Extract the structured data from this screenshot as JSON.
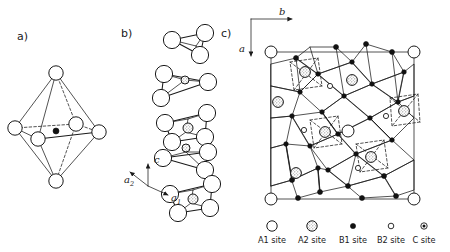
{
  "figure": {
    "type": "crystal-structure-diagram",
    "width": 450,
    "height": 252,
    "background": "#ffffff",
    "ink_color": "#1a1a1a"
  },
  "panels": [
    {
      "id": "a",
      "label": "a)",
      "label_x": 17,
      "label_y": 40,
      "description": "Single coordination octahedron with central cation",
      "center": {
        "x": 56,
        "y": 122
      }
    },
    {
      "id": "b",
      "label": "b)",
      "label_x": 121,
      "label_y": 37,
      "description": "Chain of face-sharing octahedral clusters viewed along the c axis"
    },
    {
      "id": "c",
      "label": "c)",
      "label_x": 221,
      "label_y": 37,
      "description": "Projection of the full framework onto the a-b plane"
    }
  ],
  "axes": {
    "panel_b": {
      "origin": {
        "x": 148,
        "y": 186
      },
      "items": [
        {
          "name": "c",
          "sub": "",
          "label_x": 154,
          "label_y": 163,
          "dir": "up"
        },
        {
          "name": "a",
          "sub": "2",
          "label_x": 124,
          "label_y": 183,
          "dir": "up-left"
        },
        {
          "name": "a",
          "sub": "1",
          "label_x": 171,
          "label_y": 201,
          "dir": "right"
        }
      ]
    },
    "panel_c": {
      "origin": {
        "x": 251,
        "y": 19
      },
      "items": [
        {
          "name": "b",
          "sub": "",
          "label_x": 279,
          "label_y": 15,
          "dir": "right"
        },
        {
          "name": "a",
          "sub": "",
          "label_x": 240,
          "label_y": 51,
          "dir": "down"
        }
      ]
    }
  },
  "legend": {
    "baseline_y": 226,
    "text_y": 243,
    "entries": [
      {
        "key": "A1",
        "label": "A1 site",
        "symbol": "open-circle",
        "cx": 272,
        "text_x": 272,
        "r": 5.2
      },
      {
        "key": "A2",
        "label": "A2 site",
        "symbol": "shaded-circle",
        "cx": 312,
        "text_x": 312,
        "r": 5.2
      },
      {
        "key": "B1",
        "label": "B1 site",
        "symbol": "filled-circle",
        "cx": 353,
        "text_x": 353,
        "r": 2.6
      },
      {
        "key": "B2",
        "label": "B2 site",
        "symbol": "small-open-circle",
        "cx": 391,
        "text_x": 391,
        "r": 2.8
      },
      {
        "key": "C",
        "label": "C site",
        "symbol": "dotted-circle",
        "cx": 424,
        "text_x": 424,
        "r": 3.2
      }
    ]
  },
  "site_styles": {
    "A1": {
      "fill": "#ffffff",
      "stroke": "#1a1a1a",
      "note": "large open circle"
    },
    "A2": {
      "fill": "#d8d8d8",
      "stroke": "#1a1a1a",
      "note": "large stippled circle"
    },
    "B1": {
      "fill": "#111111",
      "stroke": "#111111",
      "note": "small solid dot"
    },
    "B2": {
      "fill": "#ffffff",
      "stroke": "#1a1a1a",
      "note": "small open circle"
    },
    "C": {
      "fill": "#ffffff",
      "stroke": "#1a1a1a",
      "note": "small circle with solid core"
    }
  },
  "panel_a_geometry": {
    "vertices": [
      {
        "name": "top",
        "x": 56,
        "y": 73,
        "r": 7.2,
        "site": "A1"
      },
      {
        "name": "bottom",
        "x": 56,
        "y": 181,
        "r": 7.2,
        "site": "A1"
      },
      {
        "name": "left",
        "x": 15,
        "y": 128,
        "r": 7.2,
        "site": "A1"
      },
      {
        "name": "right",
        "x": 99,
        "y": 132,
        "r": 7.2,
        "site": "A1"
      },
      {
        "name": "front",
        "x": 38,
        "y": 139,
        "r": 7.2,
        "site": "A1"
      },
      {
        "name": "back",
        "x": 76,
        "y": 124,
        "r": 7.2,
        "site": "A1"
      }
    ],
    "center_atom": {
      "x": 56,
      "y": 131,
      "r": 3.0,
      "site": "B1"
    }
  },
  "panel_b_clusters": [
    {
      "cx": 186,
      "cy": 49,
      "scale": 1.0,
      "center_site": "none"
    },
    {
      "cx": 178,
      "cy": 85,
      "scale": 1.0,
      "center_site": "A2"
    },
    {
      "cx": 186,
      "cy": 122,
      "scale": 1.05,
      "center_site": "A2"
    },
    {
      "cx": 180,
      "cy": 160,
      "scale": 1.0,
      "center_site": "A2"
    },
    {
      "cx": 190,
      "cy": 196,
      "scale": 1.05,
      "center_site": "A2"
    }
  ],
  "panel_c_a2_sites": [
    {
      "x": 305,
      "y": 72
    },
    {
      "x": 352,
      "y": 80
    },
    {
      "x": 278,
      "y": 102
    },
    {
      "x": 404,
      "y": 111
    },
    {
      "x": 325,
      "y": 132
    },
    {
      "x": 371,
      "y": 157
    },
    {
      "x": 296,
      "y": 173
    }
  ],
  "panel_c_a1_sites": [
    {
      "x": 271,
      "y": 52
    },
    {
      "x": 414,
      "y": 52
    },
    {
      "x": 348,
      "y": 131
    },
    {
      "x": 271,
      "y": 199
    },
    {
      "x": 414,
      "y": 199
    }
  ]
}
